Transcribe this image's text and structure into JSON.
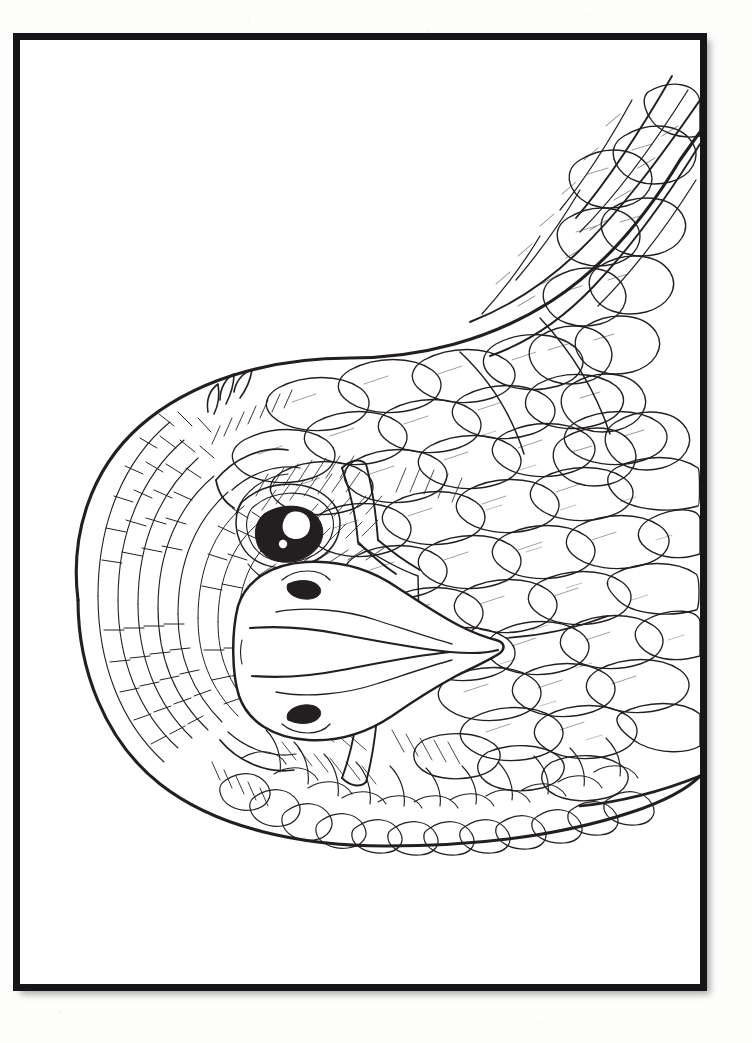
{
  "page": {
    "kind": "coloring-book-page",
    "background_color": "#fdfdfc",
    "paper_color": "#ffffff",
    "ink_color": "#231f20",
    "frame": {
      "border_color": "#16161a",
      "border_width_px": 7,
      "x": 13,
      "y": 33,
      "width": 694,
      "height": 958,
      "shadow": true
    },
    "text_content": [],
    "labels": []
  },
  "artwork": {
    "title": "Eagle Head Line Art",
    "subject": "eagle",
    "style": "black-and-white outline illustration for coloring",
    "orientation": "rotated 90 degrees; head at left, body extends to right edge",
    "fill_color": "#ffffff",
    "stroke_color": "#231f20",
    "parts": [
      {
        "name": "head-crown",
        "description": "rounded scaled feathers on back of head"
      },
      {
        "name": "upper-eye",
        "description": "eye with dark pupil and white highlight, upper position"
      },
      {
        "name": "lower-eye",
        "description": "eye with dark pupil and white highlight, lower position"
      },
      {
        "name": "beak",
        "description": "large hooked beak pointing left with nostril marks"
      },
      {
        "name": "nape-feathers",
        "description": "rows of elongated overlapping neck feathers"
      },
      {
        "name": "body-feathers",
        "description": "overlapping scalloped body feathers filling right side"
      },
      {
        "name": "wing-coverts",
        "description": "rounded scalloped covert feathers at upper right"
      },
      {
        "name": "primary-feathers",
        "description": "long sweeping flight feathers at top right"
      },
      {
        "name": "breast-fringe",
        "description": "pointed feather fringe along lower body edge"
      }
    ],
    "eyes": {
      "pupil_color": "#231f20",
      "highlight_color": "#ffffff",
      "count": 2
    }
  }
}
